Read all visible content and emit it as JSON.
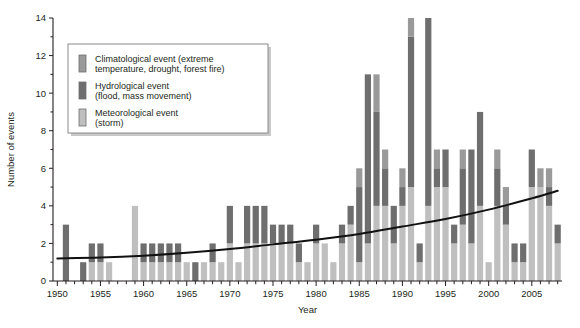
{
  "chart_data": {
    "type": "bar",
    "stacked": true,
    "title": "",
    "xlabel": "Year",
    "ylabel": "Number of events",
    "xlim": [
      1949.5,
      2008.5
    ],
    "ylim": [
      0,
      14
    ],
    "ytick_step": 2,
    "yticks": [
      0,
      2,
      4,
      6,
      8,
      10,
      12,
      14
    ],
    "xtick_labels": [
      "1950",
      "1955",
      "1960",
      "1965",
      "1970",
      "1975",
      "1980",
      "1985",
      "1990",
      "1995",
      "2000",
      "2005"
    ],
    "xtick_values": [
      1950,
      1955,
      1960,
      1965,
      1970,
      1975,
      1980,
      1985,
      1990,
      1995,
      2000,
      2005
    ],
    "grid": false,
    "legend_position": "upper-left-inset",
    "categories": [
      1950,
      1951,
      1952,
      1953,
      1954,
      1955,
      1956,
      1957,
      1958,
      1959,
      1960,
      1961,
      1962,
      1963,
      1964,
      1965,
      1966,
      1967,
      1968,
      1969,
      1970,
      1971,
      1972,
      1973,
      1974,
      1975,
      1976,
      1977,
      1978,
      1979,
      1980,
      1981,
      1982,
      1983,
      1984,
      1985,
      1986,
      1987,
      1988,
      1989,
      1990,
      1991,
      1992,
      1993,
      1994,
      1995,
      1996,
      1997,
      1998,
      1999,
      2000,
      2001,
      2002,
      2003,
      2004,
      2005,
      2006,
      2007,
      2008
    ],
    "series": [
      {
        "name": "Meteorological event (storm)",
        "key": "meteorological",
        "color": "#bfbfbf",
        "values": [
          0,
          0,
          0,
          0,
          1,
          1,
          1,
          0,
          0,
          4,
          1,
          1,
          1,
          1,
          1,
          1,
          0,
          1,
          1,
          1,
          2,
          1,
          2,
          2,
          2,
          2,
          2,
          2,
          1,
          1,
          2,
          2,
          1,
          2,
          3,
          1,
          2,
          4,
          4,
          2,
          4,
          5,
          1,
          4,
          5,
          5,
          2,
          3,
          2,
          4,
          1,
          4,
          3,
          1,
          1,
          5,
          5,
          4,
          2
        ]
      },
      {
        "name": "Hydrological event (flood, mass movement)",
        "key": "hydrological",
        "color": "#6e6e6e",
        "values": [
          0,
          3,
          0,
          1,
          1,
          1,
          0,
          0,
          0,
          0,
          1,
          1,
          1,
          1,
          1,
          0,
          1,
          0,
          1,
          0,
          2,
          0,
          2,
          2,
          2,
          1,
          1,
          1,
          1,
          0,
          1,
          0,
          0,
          1,
          1,
          4,
          9,
          5,
          2,
          2,
          1,
          8,
          1,
          10,
          1,
          2,
          1,
          3,
          5,
          5,
          0,
          2,
          1,
          1,
          1,
          2,
          0,
          1,
          1
        ]
      },
      {
        "name": "Climatological event (extreme temperature, drought, forest fire)",
        "key": "climatological",
        "color": "#9a9a9a",
        "values": [
          0,
          0,
          0,
          0,
          0,
          0,
          0,
          0,
          0,
          0,
          0,
          0,
          0,
          0,
          0,
          0,
          0,
          0,
          0,
          0,
          0,
          0,
          0,
          0,
          0,
          0,
          0,
          0,
          0,
          0,
          0,
          0,
          0,
          0,
          0,
          1,
          0,
          2,
          1,
          0,
          1,
          1,
          0,
          0,
          1,
          0,
          0,
          1,
          0,
          0,
          0,
          1,
          1,
          0,
          0,
          0,
          1,
          1,
          0
        ]
      }
    ],
    "trend": {
      "description": "smooth increasing trend curve",
      "points": [
        {
          "x": 1950,
          "y": 1.2
        },
        {
          "x": 1955,
          "y": 1.25
        },
        {
          "x": 1960,
          "y": 1.35
        },
        {
          "x": 1965,
          "y": 1.5
        },
        {
          "x": 1970,
          "y": 1.7
        },
        {
          "x": 1975,
          "y": 1.95
        },
        {
          "x": 1980,
          "y": 2.2
        },
        {
          "x": 1985,
          "y": 2.5
        },
        {
          "x": 1990,
          "y": 2.9
        },
        {
          "x": 1995,
          "y": 3.3
        },
        {
          "x": 2000,
          "y": 3.8
        },
        {
          "x": 2005,
          "y": 4.4
        },
        {
          "x": 2008,
          "y": 4.8
        }
      ]
    }
  },
  "legend": {
    "items": [
      {
        "label_line1": "Climatological event (extreme",
        "label_line2": "temperature, drought, forest fire)",
        "color": "#9a9a9a",
        "name": "legend-item-climatological"
      },
      {
        "label_line1": "Hydrological event",
        "label_line2": "(flood, mass movement)",
        "color": "#6e6e6e",
        "name": "legend-item-hydrological"
      },
      {
        "label_line1": "Meteorological event",
        "label_line2": "(storm)",
        "color": "#bfbfbf",
        "name": "legend-item-meteorological"
      }
    ]
  }
}
